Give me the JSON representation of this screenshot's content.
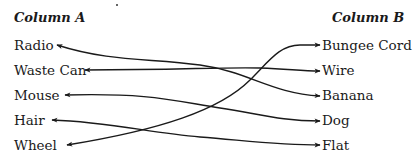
{
  "column_a": {
    "header": "Column A",
    "items": [
      "Radio",
      "Waste Can",
      "Mouse",
      "Hair",
      "Wheel"
    ]
  },
  "column_b": {
    "header": "Column B",
    "items": [
      "Bungee Cord",
      "Wire",
      "Banana",
      "Dog",
      "Flat"
    ]
  },
  "connections": [
    {
      "from": "Radio",
      "to": "Banana"
    },
    {
      "from": "Waste Can",
      "to": "Wire"
    },
    {
      "from": "Mouse",
      "to": "Dog"
    },
    {
      "from": "Hair",
      "to": "Flat"
    },
    {
      "from": "Wheel",
      "to": "Bungee Cord"
    }
  ],
  "colors": {
    "line": "#1a1a1a",
    "text": "#1a1a1a"
  }
}
